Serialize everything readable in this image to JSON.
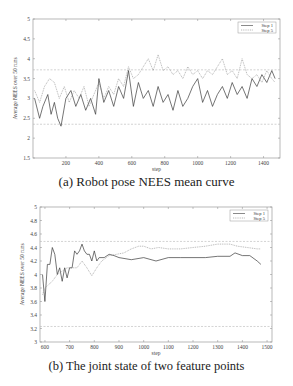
{
  "chart_data": [
    {
      "id": "a",
      "type": "line",
      "title": "",
      "caption": "(a) Robot pose NEES mean curve",
      "xlabel": "step",
      "ylabel": "Average NEES over 50 runs",
      "xlim": [
        0,
        1500
      ],
      "ylim": [
        1.5,
        5
      ],
      "xticks": [
        200,
        400,
        600,
        800,
        1000,
        1200,
        1400
      ],
      "yticks": [
        1.5,
        2,
        2.5,
        3,
        3.5,
        4,
        4.5,
        5
      ],
      "ytick_labels": [
        "1.5",
        "2",
        "2.5",
        "3",
        "3.5",
        "4",
        "4.5",
        "5"
      ],
      "grid": false,
      "legend_position": "upper right",
      "reference_lines": [
        3.72,
        2.35
      ],
      "series": [
        {
          "name": "Step 1",
          "style": "solid",
          "x": [
            10,
            40,
            60,
            90,
            110,
            130,
            150,
            170,
            200,
            230,
            260,
            290,
            320,
            350,
            380,
            400,
            430,
            460,
            490,
            520,
            550,
            580,
            610,
            640,
            670,
            700,
            730,
            760,
            790,
            820,
            850,
            880,
            910,
            940,
            970,
            1000,
            1030,
            1060,
            1090,
            1120,
            1150,
            1180,
            1210,
            1240,
            1270,
            1300,
            1330,
            1360,
            1390,
            1420,
            1450,
            1470
          ],
          "values": [
            3.0,
            2.5,
            2.8,
            3.1,
            2.6,
            2.9,
            2.5,
            2.3,
            3.0,
            3.2,
            2.8,
            3.1,
            2.7,
            3.0,
            2.6,
            3.5,
            2.9,
            3.2,
            2.8,
            3.3,
            3.0,
            3.7,
            2.8,
            3.4,
            3.0,
            3.2,
            2.8,
            3.3,
            2.9,
            3.1,
            2.7,
            3.2,
            2.8,
            3.0,
            3.3,
            3.5,
            2.9,
            3.2,
            2.8,
            3.1,
            3.3,
            3.0,
            3.4,
            3.1,
            3.3,
            3.0,
            3.5,
            3.3,
            3.6,
            3.4,
            3.7,
            3.5
          ]
        },
        {
          "name": "Step 5",
          "style": "dotted",
          "x": [
            10,
            40,
            70,
            100,
            130,
            160,
            190,
            220,
            250,
            280,
            310,
            340,
            370,
            400,
            430,
            460,
            490,
            520,
            550,
            580,
            610,
            640,
            670,
            700,
            730,
            760,
            790,
            820,
            850,
            880,
            910,
            940,
            970,
            1000,
            1030,
            1060,
            1090,
            1120,
            1150,
            1180,
            1210,
            1240,
            1270,
            1300,
            1330,
            1360,
            1390,
            1420,
            1450,
            1470
          ],
          "values": [
            3.2,
            2.9,
            3.3,
            3.5,
            3.4,
            3.0,
            3.3,
            2.9,
            3.2,
            3.0,
            3.3,
            2.8,
            3.1,
            3.4,
            3.0,
            3.3,
            3.1,
            3.5,
            3.3,
            3.8,
            3.5,
            3.6,
            3.8,
            4.0,
            3.7,
            4.1,
            3.7,
            3.8,
            3.6,
            3.7,
            3.5,
            3.8,
            3.6,
            3.7,
            3.5,
            3.7,
            3.6,
            3.8,
            4.0,
            3.6,
            3.7,
            3.5,
            4.0,
            3.6,
            3.5,
            3.6,
            3.4,
            3.7,
            3.5,
            3.4
          ]
        }
      ]
    },
    {
      "id": "b",
      "type": "line",
      "title": "",
      "caption": "(b) The joint state of two feature points",
      "xlabel": "step",
      "ylabel": "Average NEES over 50 runs",
      "xlim": [
        580,
        1520
      ],
      "ylim": [
        3,
        5
      ],
      "xticks": [
        600,
        700,
        800,
        900,
        1000,
        1100,
        1200,
        1300,
        1400,
        1500
      ],
      "yticks": [
        3,
        3.2,
        3.4,
        3.6,
        3.8,
        4,
        4.2,
        4.4,
        4.6,
        4.8,
        5
      ],
      "ytick_labels": [
        "3",
        "3.2",
        "3.4",
        "3.6",
        "3.8",
        "4",
        "4.2",
        "4.4",
        "4.6",
        "4.8",
        "5"
      ],
      "grid": false,
      "legend_position": "upper right",
      "reference_lines": [
        4.49,
        3.23
      ],
      "series": [
        {
          "name": "Step 1",
          "style": "solid",
          "x": [
            590,
            600,
            610,
            620,
            630,
            640,
            650,
            660,
            670,
            680,
            690,
            700,
            710,
            720,
            730,
            740,
            750,
            760,
            770,
            780,
            790,
            800,
            810,
            820,
            840,
            860,
            880,
            900,
            950,
            1000,
            1050,
            1100,
            1150,
            1200,
            1250,
            1300,
            1350,
            1370,
            1400,
            1430,
            1460,
            1475
          ],
          "values": [
            4.0,
            3.6,
            4.15,
            4.15,
            4.4,
            4.3,
            4.0,
            4.1,
            3.9,
            4.1,
            3.95,
            4.1,
            4.1,
            4.35,
            4.3,
            4.35,
            4.45,
            4.35,
            4.3,
            4.3,
            4.2,
            4.35,
            4.2,
            4.25,
            4.25,
            4.3,
            4.28,
            4.25,
            4.22,
            4.25,
            4.2,
            4.25,
            4.25,
            4.25,
            4.25,
            4.27,
            4.27,
            4.32,
            4.28,
            4.28,
            4.2,
            4.15
          ]
        },
        {
          "name": "Step 5",
          "style": "dotted",
          "x": [
            590,
            600,
            615,
            630,
            650,
            670,
            690,
            710,
            730,
            750,
            770,
            790,
            810,
            830,
            860,
            890,
            920,
            950,
            980,
            1000,
            1030,
            1060,
            1100,
            1150,
            1200,
            1250,
            1300,
            1350,
            1380,
            1420,
            1460,
            1475
          ],
          "values": [
            3.7,
            3.8,
            3.85,
            3.9,
            4.0,
            4.05,
            4.1,
            4.1,
            4.1,
            4.2,
            4.1,
            3.98,
            4.1,
            4.2,
            4.28,
            4.3,
            4.32,
            4.38,
            4.42,
            4.42,
            4.38,
            4.4,
            4.38,
            4.38,
            4.4,
            4.42,
            4.45,
            4.45,
            4.42,
            4.4,
            4.38,
            4.38
          ]
        }
      ]
    }
  ]
}
